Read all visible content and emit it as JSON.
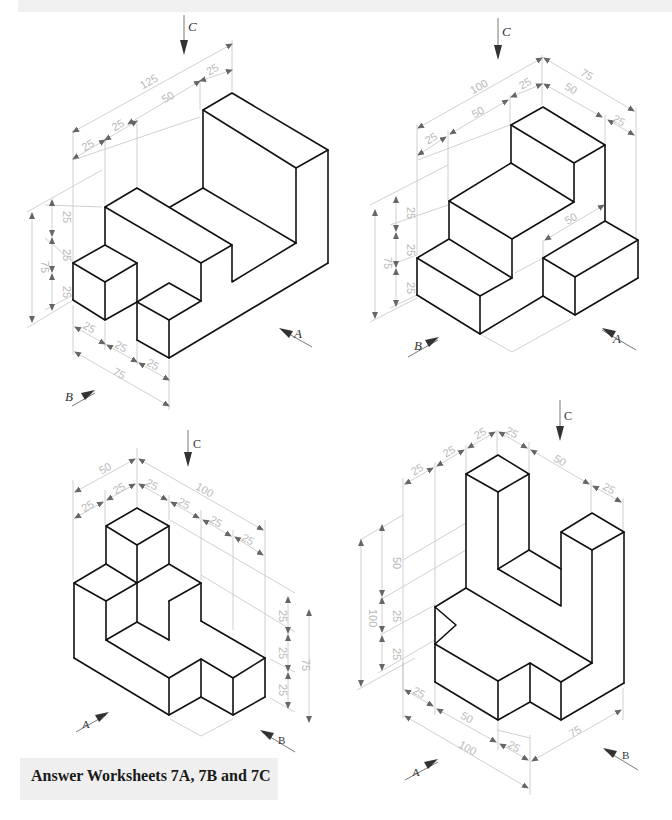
{
  "caption": "Answer Worksheets 7A, 7B and 7C",
  "colors": {
    "background": "#ffffff",
    "edges": "#111111",
    "dimension_lines": "#c4c4c4",
    "dimension_text": "#b8b8b8",
    "caption_box": "#efefef",
    "top_band": "#f0f0f0"
  },
  "figures": [
    {
      "id": "figure-1",
      "view_labels": {
        "c": "C",
        "a": "A",
        "b": "B"
      },
      "dimensions": {
        "top_overall": "125",
        "top_right": "25",
        "top_mid": "50",
        "top_left_2": "25",
        "top_left_1": "25",
        "height_overall": "75",
        "height_1": "25",
        "height_2": "25",
        "height_3": "25",
        "bottom_1": "25",
        "bottom_2": "25",
        "bottom_3": "25",
        "bottom_overall": "75"
      }
    },
    {
      "id": "figure-2",
      "view_labels": {
        "c": "C",
        "a": "A",
        "b": "B"
      },
      "dimensions": {
        "top_overall": "100",
        "top_right": "25",
        "top_mid": "50",
        "top_left": "25",
        "depth_overall": "75",
        "depth_1": "50",
        "depth_2": "25",
        "height_overall": "75",
        "height_1": "25",
        "height_2": "25",
        "height_3": "25",
        "inner": "50"
      }
    },
    {
      "id": "figure-3",
      "view_labels": {
        "c": "C",
        "a": "A",
        "b": "B"
      },
      "dimensions": {
        "left_overall": "50",
        "left_1": "25",
        "left_2": "25",
        "right_overall": "100",
        "right_1": "25",
        "right_2": "25",
        "right_3": "25",
        "right_4": "25",
        "height_overall": "75",
        "height_1": "25",
        "height_2": "25",
        "height_3": "25"
      }
    },
    {
      "id": "figure-4",
      "view_labels": {
        "c": "C",
        "a": "A",
        "b": "B"
      },
      "dimensions": {
        "top_left_1": "25",
        "top_left_2": "25",
        "top_left_3": "25",
        "top_right_1": "25",
        "top_right_2": "50",
        "top_right_3": "25",
        "height_overall": "100",
        "height_1": "50",
        "height_2": "25",
        "height_3": "25",
        "bottom_1": "25",
        "bottom_2": "50",
        "bottom_overall": "100",
        "bottom_3": "25",
        "bottom_right": "75"
      }
    }
  ]
}
